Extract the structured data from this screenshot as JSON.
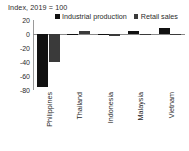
{
  "chart_data": {
    "type": "bar",
    "title": "Index, 2019 = 100",
    "xlabel": "",
    "ylabel": "",
    "ylim": [
      -80,
      20
    ],
    "yticks": [
      20,
      0,
      -20,
      -40,
      -60,
      -80
    ],
    "ytick_labels": [
      "20",
      "0",
      "-20",
      "-40",
      "-60",
      "-80"
    ],
    "grid": false,
    "legend_position": "top",
    "categories": [
      "Philippines",
      "Thailand",
      "Indonesia",
      "Malaysia",
      "Vietnam"
    ],
    "series": [
      {
        "name": "Industrial production",
        "color": "#111111",
        "values": [
          -75,
          -1,
          -1,
          5,
          9
        ]
      },
      {
        "name": "Retail sales",
        "color": "#3a3a3a",
        "values": [
          -40,
          5,
          -3,
          -2,
          -2
        ]
      }
    ]
  },
  "colors": {
    "industrial_production": "#111111",
    "retail_sales": "#3a3a3a",
    "axis": "#8a8a8a",
    "text": "#2b2b2b",
    "background": "#ffffff"
  }
}
